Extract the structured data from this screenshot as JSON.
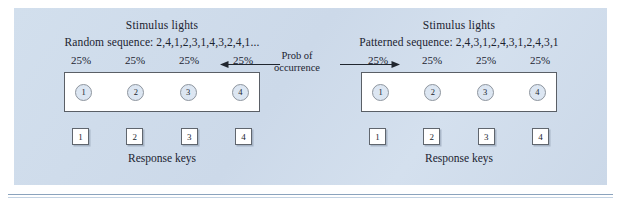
{
  "figure": {
    "panel_color": "#cfdceb",
    "center_annotation": {
      "line1": "Prob of",
      "line2": "occurrence"
    },
    "conditions": [
      {
        "id": "random",
        "heading": "Stimulus lights",
        "sequence_label": "Random sequence: 2,4,1,2,3,1,4,3,2,4,1...",
        "probabilities": [
          "25%",
          "25%",
          "25%",
          "25%"
        ],
        "lights": [
          "1",
          "2",
          "3",
          "4"
        ],
        "keys": [
          "1",
          "2",
          "3",
          "4"
        ],
        "keys_caption": "Response keys"
      },
      {
        "id": "patterned",
        "heading": "Stimulus lights",
        "sequence_label": "Patterned sequence: 2,4,3,1,2,4,3,1,2,4,3,1",
        "probabilities": [
          "25%",
          "25%",
          "25%",
          "25%"
        ],
        "lights": [
          "1",
          "2",
          "3",
          "4"
        ],
        "keys": [
          "1",
          "2",
          "3",
          "4"
        ],
        "keys_caption": "Response keys"
      }
    ]
  }
}
